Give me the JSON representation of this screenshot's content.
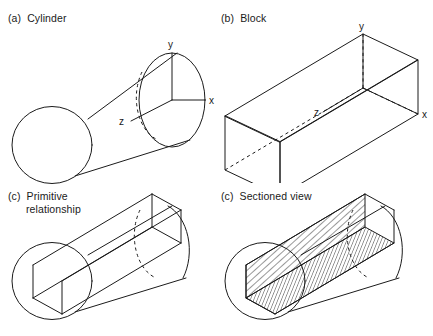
{
  "figure": {
    "background_color": "#ffffff",
    "line_color": "#1b1b1b",
    "text_color": "#1a1a1a"
  },
  "panels": [
    {
      "id": "a",
      "label": "(a)  Cylinder",
      "label_lines": [
        "(a)  Cylinder"
      ],
      "shape": "cylinder",
      "axes": [
        {
          "name": "y",
          "label": "y"
        },
        {
          "name": "x",
          "label": "x"
        },
        {
          "name": "z",
          "label": "z"
        }
      ],
      "hidden_lines": "dashed back half of far circular face"
    },
    {
      "id": "b",
      "label": "(b)  Block",
      "label_lines": [
        "(b)  Block"
      ],
      "shape": "block",
      "axes": [
        {
          "name": "y",
          "label": "y"
        },
        {
          "name": "x",
          "label": "x"
        },
        {
          "name": "z",
          "label": "z"
        }
      ],
      "hidden_lines": "dashed hidden bottom-rear edge"
    },
    {
      "id": "c",
      "label": "(c)  Primitive relationship",
      "label_lines": [
        "(c)  Primitive",
        "relationship"
      ],
      "shape": "cylinder-with-block-intersection",
      "axes": [],
      "hidden_lines": "dashed hidden circular arc of far cylinder face"
    },
    {
      "id": "d",
      "label": "(c)  Sectioned view",
      "label_lines": [
        "(c)  Sectioned view"
      ],
      "shape": "cylinder-sectioned-by-block",
      "axes": [],
      "hatching": {
        "vertical_face": "steep diagonal hatch",
        "floor_face": "shallow diagonal hatch"
      },
      "hidden_lines": "dashed hidden arc at far end"
    }
  ],
  "axis_labels": {
    "x": "x",
    "y": "y",
    "z": "z"
  }
}
